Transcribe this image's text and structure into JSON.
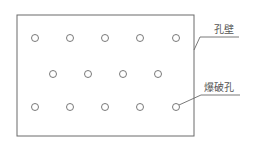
{
  "diagram": {
    "labels": {
      "hole_wall": "孔壁",
      "blast_hole": "爆破孔"
    },
    "colors": {
      "stroke": "#6a6a6a",
      "text": "#555555",
      "background": "#ffffff"
    },
    "wall_rect": {
      "x": 17,
      "y": 15,
      "width": 177,
      "height": 121
    },
    "hole_radius": 3.5,
    "rows": [
      {
        "y": 38,
        "x": [
          35,
          70,
          105,
          140,
          176
        ]
      },
      {
        "y": 74,
        "x": [
          53,
          88,
          123,
          158
        ]
      },
      {
        "y": 107,
        "x": [
          35,
          70,
          105,
          140,
          176
        ]
      }
    ]
  }
}
